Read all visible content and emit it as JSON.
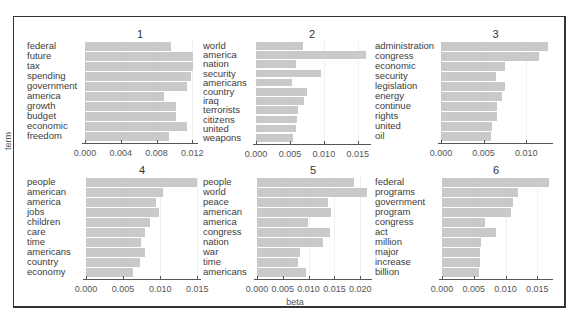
{
  "chart_data": [
    {
      "type": "bar",
      "orientation": "horizontal",
      "title": "1",
      "categories": [
        "federal",
        "future",
        "tax",
        "spending",
        "government",
        "america",
        "growth",
        "budget",
        "economic",
        "freedom"
      ],
      "values": [
        0.0096,
        0.0121,
        0.0121,
        0.0119,
        0.0114,
        0.0088,
        0.0102,
        0.0102,
        0.0114,
        0.0094
      ],
      "xlim": [
        0,
        0.0123
      ],
      "ticks": [
        0,
        0.004,
        0.008,
        0.012
      ],
      "tick_labels": [
        "0.000",
        "0.004",
        "0.008",
        "0.012"
      ]
    },
    {
      "type": "bar",
      "orientation": "horizontal",
      "title": "2",
      "categories": [
        "world",
        "america",
        "nation",
        "security",
        "americans",
        "country",
        "iraq",
        "terrorists",
        "citizens",
        "united",
        "weapons"
      ],
      "values": [
        0.0069,
        0.0162,
        0.0059,
        0.0096,
        0.0053,
        0.0075,
        0.0071,
        0.0062,
        0.006,
        0.0059,
        0.0054
      ],
      "xlim": [
        0,
        0.0165
      ],
      "ticks": [
        0,
        0.005,
        0.01,
        0.015
      ],
      "tick_labels": [
        "0.000",
        "0.005",
        "0.010",
        "0.015"
      ]
    },
    {
      "type": "bar",
      "orientation": "horizontal",
      "title": "3",
      "categories": [
        "administration",
        "congress",
        "economic",
        "security",
        "legislation",
        "energy",
        "continue",
        "rights",
        "united",
        "oil"
      ],
      "values": [
        0.0126,
        0.0115,
        0.0075,
        0.0064,
        0.0075,
        0.0072,
        0.0066,
        0.0066,
        0.006,
        0.0059
      ],
      "xlim": [
        0,
        0.0128
      ],
      "ticks": [
        0,
        0.005,
        0.01
      ],
      "tick_labels": [
        "0.000",
        "0.005",
        "0.010"
      ]
    },
    {
      "type": "bar",
      "orientation": "horizontal",
      "title": "4",
      "categories": [
        "people",
        "american",
        "america",
        "jobs",
        "children",
        "care",
        "time",
        "americans",
        "country",
        "economy"
      ],
      "values": [
        0.0149,
        0.0104,
        0.0094,
        0.0099,
        0.0086,
        0.008,
        0.0074,
        0.0079,
        0.0073,
        0.0064
      ],
      "xlim": [
        0,
        0.0151
      ],
      "ticks": [
        0,
        0.005,
        0.01,
        0.015
      ],
      "tick_labels": [
        "0.000",
        "0.005",
        "0.010",
        "0.015"
      ]
    },
    {
      "type": "bar",
      "orientation": "horizontal",
      "title": "5",
      "categories": [
        "people",
        "world",
        "peace",
        "american",
        "america",
        "congress",
        "nation",
        "war",
        "time",
        "americans"
      ],
      "values": [
        0.0188,
        0.0214,
        0.0137,
        0.0144,
        0.0099,
        0.0141,
        0.0128,
        0.0083,
        0.0079,
        0.0095
      ],
      "xlim": [
        0,
        0.0217
      ],
      "ticks": [
        0,
        0.005,
        0.01,
        0.015,
        0.02
      ],
      "tick_labels": [
        "0.000",
        "0.005",
        "0.010",
        "0.015",
        "0.020"
      ]
    },
    {
      "type": "bar",
      "orientation": "horizontal",
      "title": "6",
      "categories": [
        "federal",
        "programs",
        "government",
        "program",
        "congress",
        "act",
        "million",
        "major",
        "increase",
        "billion"
      ],
      "values": [
        0.0168,
        0.012,
        0.0112,
        0.0109,
        0.0068,
        0.0085,
        0.0061,
        0.006,
        0.006,
        0.0058
      ],
      "xlim": [
        0,
        0.017
      ],
      "ticks": [
        0,
        0.005,
        0.01,
        0.015
      ],
      "tick_labels": [
        "0.000",
        "0.005",
        "0.010",
        "0.015"
      ]
    }
  ],
  "axes": {
    "ylabel": "term",
    "xlabel": "beta"
  },
  "colors": {
    "bar": "#c9c9c9",
    "axis": "#555555",
    "frame": "#333333"
  }
}
